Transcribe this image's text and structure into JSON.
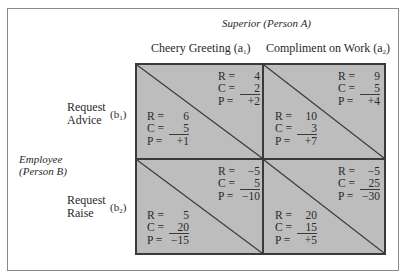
{
  "column_player": {
    "label": "Superior",
    "person": "(Person A)"
  },
  "row_player": {
    "label": "Employee",
    "person": "(Person B)"
  },
  "columns": [
    {
      "label": "Cheery Greeting",
      "code": "a",
      "sub": "1"
    },
    {
      "label": "Compliment on Work",
      "code": "a",
      "sub": "2"
    }
  ],
  "rows": [
    {
      "line1": "Request",
      "line2": "Advice",
      "code": "b",
      "sub": "1"
    },
    {
      "line1": "Request",
      "line2": "Raise",
      "code": "b",
      "sub": "2"
    }
  ],
  "cells": [
    {
      "row": 0,
      "col": 0,
      "superior": {
        "R": "4",
        "C": "2",
        "P": "+2"
      },
      "employee": {
        "R": "6",
        "C": "5",
        "P": "+1"
      }
    },
    {
      "row": 0,
      "col": 1,
      "superior": {
        "R": "9",
        "C": "5",
        "P": "+4"
      },
      "employee": {
        "R": "10",
        "C": "3",
        "P": "+7"
      }
    },
    {
      "row": 1,
      "col": 0,
      "superior": {
        "R": "−5",
        "C": "5",
        "P": "−10"
      },
      "employee": {
        "R": "5",
        "C": "20",
        "P": "−15"
      }
    },
    {
      "row": 1,
      "col": 1,
      "superior": {
        "R": "−5",
        "C": "25",
        "P": "−30"
      },
      "employee": {
        "R": "20",
        "C": "15",
        "P": "+5"
      }
    }
  ],
  "labels": {
    "R": "R =",
    "C": "C =",
    "P": "P ="
  },
  "colors": {
    "cell_fill": "#bdbdbd",
    "lines": "#3a3a3a",
    "frame": "#8a8a8a"
  }
}
